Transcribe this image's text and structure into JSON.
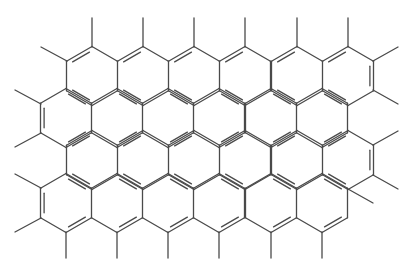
{
  "diagram": {
    "type": "chemical-structure",
    "colors": {
      "background": "#ffffff",
      "bond": "#4a4a4a"
    },
    "geometry": {
      "bond_length": 29.5,
      "ring_width": 51,
      "row_spacing": 42.5
    },
    "ring_rows": [
      {
        "cy": 76,
        "cx": [
          92,
          143,
          194,
          245,
          297,
          348
        ]
      },
      {
        "cy": 118,
        "cx": [
          66,
          117,
          168,
          219,
          271,
          322
        ]
      },
      {
        "cy": 160,
        "cx": [
          92,
          143,
          194,
          245,
          297,
          348
        ]
      },
      {
        "cy": 203,
        "cx": [
          66,
          117,
          168,
          219,
          271,
          322
        ]
      }
    ],
    "methyls": [
      [
        92,
        47,
        92,
        18
      ],
      [
        143,
        47,
        143,
        18
      ],
      [
        194,
        47,
        194,
        18
      ],
      [
        245,
        47,
        245,
        18
      ],
      [
        297,
        47,
        297,
        18
      ],
      [
        348,
        47,
        348,
        18
      ],
      [
        67,
        61,
        41,
        47
      ],
      [
        373,
        61,
        398,
        47
      ],
      [
        373,
        90,
        398,
        104
      ],
      [
        41,
        104,
        15,
        90
      ],
      [
        41,
        133,
        15,
        147
      ],
      [
        373,
        145,
        398,
        131
      ],
      [
        373,
        175,
        398,
        189
      ],
      [
        41,
        188,
        15,
        174
      ],
      [
        41,
        218,
        15,
        232
      ],
      [
        348,
        189,
        373,
        203
      ],
      [
        66,
        232,
        66,
        258
      ],
      [
        117,
        232,
        117,
        258
      ],
      [
        168,
        232,
        168,
        258
      ],
      [
        219,
        232,
        219,
        258
      ],
      [
        271,
        232,
        271,
        258
      ],
      [
        322,
        232,
        322,
        258
      ]
    ]
  }
}
